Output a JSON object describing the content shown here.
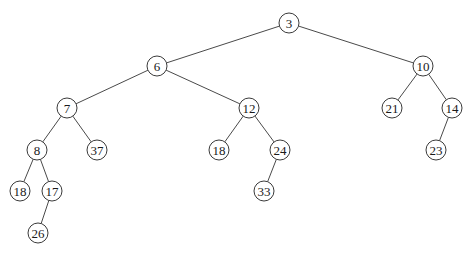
{
  "diagram": {
    "type": "binary-tree",
    "root": "n3",
    "nodes": [
      {
        "id": "n3",
        "label": "3",
        "x": 289,
        "y": 23
      },
      {
        "id": "n6",
        "label": "6",
        "x": 157,
        "y": 66
      },
      {
        "id": "n10",
        "label": "10",
        "x": 423,
        "y": 66
      },
      {
        "id": "n7",
        "label": "7",
        "x": 67,
        "y": 108
      },
      {
        "id": "n12",
        "label": "12",
        "x": 249,
        "y": 108
      },
      {
        "id": "n21",
        "label": "21",
        "x": 392,
        "y": 108
      },
      {
        "id": "n14",
        "label": "14",
        "x": 452,
        "y": 108
      },
      {
        "id": "n8",
        "label": "8",
        "x": 37,
        "y": 150
      },
      {
        "id": "n37",
        "label": "37",
        "x": 97,
        "y": 150
      },
      {
        "id": "n18b",
        "label": "18",
        "x": 219,
        "y": 150
      },
      {
        "id": "n24",
        "label": "24",
        "x": 280,
        "y": 150
      },
      {
        "id": "n23",
        "label": "23",
        "x": 436,
        "y": 150
      },
      {
        "id": "n18a",
        "label": "18",
        "x": 20,
        "y": 191
      },
      {
        "id": "n17",
        "label": "17",
        "x": 52,
        "y": 191
      },
      {
        "id": "n33",
        "label": "33",
        "x": 264,
        "y": 191
      },
      {
        "id": "n26",
        "label": "26",
        "x": 38,
        "y": 233
      }
    ],
    "edges": [
      [
        "n3",
        "n6"
      ],
      [
        "n3",
        "n10"
      ],
      [
        "n6",
        "n7"
      ],
      [
        "n6",
        "n12"
      ],
      [
        "n10",
        "n21"
      ],
      [
        "n10",
        "n14"
      ],
      [
        "n7",
        "n8"
      ],
      [
        "n7",
        "n37"
      ],
      [
        "n12",
        "n18b"
      ],
      [
        "n12",
        "n24"
      ],
      [
        "n14",
        "n23"
      ],
      [
        "n8",
        "n18a"
      ],
      [
        "n8",
        "n17"
      ],
      [
        "n24",
        "n33"
      ],
      [
        "n17",
        "n26"
      ]
    ],
    "node_radius": 10
  }
}
